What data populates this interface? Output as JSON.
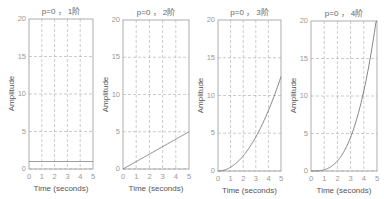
{
  "chart_data": [
    {
      "type": "line",
      "title": "p=0 ， 1阶",
      "xlabel": "Time (seconds)",
      "ylabel": "Amplitude",
      "xlim": [
        0,
        5
      ],
      "ylim": [
        0,
        20
      ],
      "xticks": [
        "0",
        "1",
        "2",
        "3",
        "4",
        "5"
      ],
      "yticks": [
        "0",
        "5",
        "10",
        "15",
        "20"
      ],
      "grid": true,
      "series": [
        {
          "name": "1阶",
          "x": [
            0,
            1,
            2,
            3,
            4,
            5
          ],
          "values": [
            1,
            1,
            1,
            1,
            1,
            1
          ]
        }
      ]
    },
    {
      "type": "line",
      "title": "p=0 ， 2阶",
      "xlabel": "Time (seconds)",
      "ylabel": "Amplitude",
      "xlim": [
        0,
        5
      ],
      "ylim": [
        0,
        20
      ],
      "xticks": [
        "0",
        "1",
        "2",
        "3",
        "4",
        "5"
      ],
      "yticks": [
        "0",
        "5",
        "10",
        "15",
        "20"
      ],
      "grid": true,
      "series": [
        {
          "name": "2阶",
          "x": [
            0,
            1,
            2,
            3,
            4,
            5
          ],
          "values": [
            0,
            1,
            2,
            3,
            4,
            5
          ]
        }
      ]
    },
    {
      "type": "line",
      "title": "p=0 ， 3阶",
      "xlabel": "Time (seconds)",
      "ylabel": "Amplitude",
      "xlim": [
        0,
        5
      ],
      "ylim": [
        0,
        20
      ],
      "xticks": [
        "0",
        "1",
        "2",
        "3",
        "4",
        "5"
      ],
      "yticks": [
        "0",
        "5",
        "10",
        "15",
        "20"
      ],
      "grid": true,
      "series": [
        {
          "name": "3阶",
          "x": [
            0,
            1,
            2,
            3,
            4,
            5
          ],
          "values": [
            0,
            0.5,
            2,
            4.5,
            8,
            12.5
          ]
        }
      ]
    },
    {
      "type": "line",
      "title": "p=0 ， 4阶",
      "xlabel": "Time (seconds)",
      "ylabel": "Amplitude",
      "xlim": [
        0,
        5
      ],
      "ylim": [
        0,
        20
      ],
      "xticks": [
        "0",
        "1",
        "2",
        "3",
        "4",
        "5"
      ],
      "yticks": [
        "0",
        "5",
        "10",
        "15",
        "20"
      ],
      "grid": true,
      "series": [
        {
          "name": "4阶",
          "x": [
            0,
            1,
            2,
            3,
            4,
            5
          ],
          "values": [
            0,
            0.17,
            1.33,
            4.5,
            10.67,
            20
          ]
        }
      ]
    }
  ],
  "colors": {
    "axis": "#999999",
    "grid": "#aaaaaa",
    "line": "#777777"
  }
}
